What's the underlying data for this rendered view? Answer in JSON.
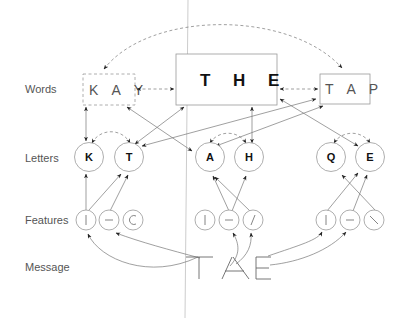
{
  "diagram": {
    "row_labels": {
      "words": "Words",
      "letters": "Letters",
      "features": "Features",
      "message": "Message"
    },
    "words": [
      {
        "id": "kay",
        "label": "K A Y",
        "style": "dashed",
        "emphasis": "light"
      },
      {
        "id": "the",
        "label": "T H E",
        "style": "solid",
        "emphasis": "bold"
      },
      {
        "id": "tap",
        "label": "T A P",
        "style": "solid",
        "emphasis": "light"
      }
    ],
    "letters": [
      {
        "id": "K",
        "label": "K"
      },
      {
        "id": "T",
        "label": "T"
      },
      {
        "id": "A",
        "label": "A"
      },
      {
        "id": "H",
        "label": "H"
      },
      {
        "id": "Q",
        "label": "Q"
      },
      {
        "id": "E",
        "label": "E"
      }
    ],
    "feature_groups": [
      {
        "position": 1,
        "features": [
          "|",
          "–",
          "C"
        ]
      },
      {
        "position": 2,
        "features": [
          "|",
          "–",
          "/"
        ]
      },
      {
        "position": 3,
        "features": [
          "|",
          "–",
          "\\"
        ]
      }
    ],
    "message": "T /-\\ E",
    "message_label": "TAE",
    "connections": {
      "inhibitory_dashed": [
        "KAY<->THE",
        "THE<->TAP",
        "KAY<->TAP",
        "K<->T",
        "A<->H",
        "Q<->E"
      ],
      "excitatory_solid": [
        "KAY<->K",
        "KAY<->A",
        "THE<->T",
        "THE<->H",
        "THE<->E",
        "TAP<->T",
        "TAP<->A",
        "features->letters",
        "message->features"
      ]
    }
  }
}
